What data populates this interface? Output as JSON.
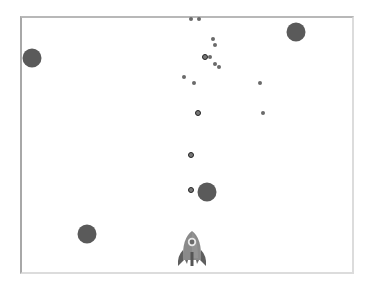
{
  "game": {
    "frame": {
      "border_color": "#b8b8b8",
      "background": "#ffffff"
    },
    "colors": {
      "asteroid": "#5a5a5a",
      "bullet_fill": "#777777",
      "bullet_ring": "#222222",
      "debris": "#6a6a6a",
      "rocket_body": "#8a8a8a",
      "rocket_fins": "#5e5e5e"
    },
    "asteroids": [
      {
        "x": 32,
        "y": 58,
        "size": 19
      },
      {
        "x": 296,
        "y": 32,
        "size": 19
      },
      {
        "x": 207,
        "y": 192,
        "size": 19
      },
      {
        "x": 87,
        "y": 234,
        "size": 19
      }
    ],
    "bullets": [
      {
        "x": 205,
        "y": 57
      },
      {
        "x": 198,
        "y": 113
      },
      {
        "x": 191,
        "y": 155
      },
      {
        "x": 191,
        "y": 190
      }
    ],
    "debris": [
      {
        "x": 191,
        "y": 19
      },
      {
        "x": 199,
        "y": 19
      },
      {
        "x": 213,
        "y": 39
      },
      {
        "x": 215,
        "y": 45
      },
      {
        "x": 210,
        "y": 57
      },
      {
        "x": 215,
        "y": 64
      },
      {
        "x": 219,
        "y": 67
      },
      {
        "x": 184,
        "y": 77
      },
      {
        "x": 194,
        "y": 83
      },
      {
        "x": 260,
        "y": 83
      },
      {
        "x": 263,
        "y": 113
      }
    ],
    "player": {
      "name": "rocket",
      "x": 192,
      "y": 251
    }
  }
}
